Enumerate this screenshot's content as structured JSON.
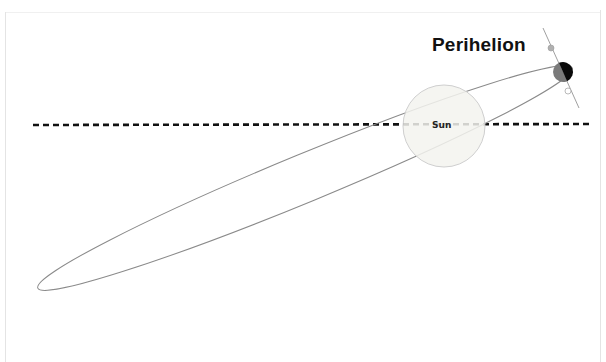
{
  "diagram": {
    "perihelion_label": "Perihelion",
    "sun_label": "Sun",
    "colors": {
      "orbit": "#8a8a8a",
      "dashed_line": "#111111",
      "sun_fill": "#f3f3ef",
      "sun_border": "#cfcfcf",
      "planet_dark": "#0a0a0a",
      "planet_lit": "#7a7a7a",
      "axis": "#a0a0a0",
      "marker_top": "#b0b0b0",
      "marker_bottom": "#ffffff"
    },
    "elements": {
      "sun": {
        "cx": 444,
        "cy": 126,
        "r": 41
      },
      "orbit": {
        "cx": 305,
        "cy": 178,
        "rx": 289,
        "ry": 24,
        "rotation_deg": -22.4
      },
      "planet": {
        "cx": 563,
        "cy": 72,
        "r": 10
      },
      "reference_line": {
        "x1": 33,
        "y1": 125,
        "x2": 592,
        "y2": 124,
        "style": "dashed"
      }
    }
  }
}
